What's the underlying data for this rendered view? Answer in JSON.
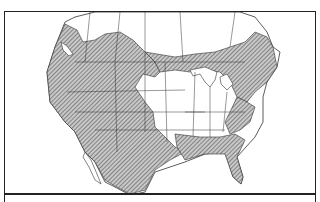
{
  "map": {
    "title": "",
    "region": "North America",
    "caption": "",
    "colors": {
      "border": "#222222",
      "hatch": "#555555",
      "land": "#ffffff",
      "background": "#ffffff"
    },
    "legend": [],
    "shaded_regions": [
      "western-north-america",
      "northern-great-lakes-belt",
      "appalachian-northeast-belt",
      "gulf-coast-and-florida",
      "mexico"
    ],
    "unshaded_regions": [
      "central-midwest",
      "southeast-interior",
      "northern-canada"
    ]
  }
}
